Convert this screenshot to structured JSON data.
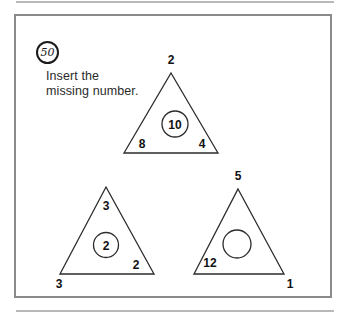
{
  "question": {
    "number": "50",
    "prompt_line1": "Insert the",
    "prompt_line2": "missing number."
  },
  "puzzle": {
    "type": "missing-number-triangles",
    "triangles": [
      {
        "id": "triangle-top",
        "apex_label": "2",
        "bottom_left_label": "8",
        "bottom_right_label": "4",
        "center_circle_label": "10",
        "center_circle_empty": false
      },
      {
        "id": "triangle-bottom-left",
        "apex_label": "3",
        "bottom_left_label": "3",
        "bottom_right_label": "2",
        "center_circle_label": "2",
        "center_circle_empty": false
      },
      {
        "id": "triangle-bottom-right",
        "apex_label": "5",
        "bottom_left_label": "12",
        "bottom_right_label": "1",
        "center_circle_label": "",
        "center_circle_empty": true
      }
    ]
  },
  "colors": {
    "ink": "#2b2b2b",
    "panel_border": "#8a8a8a",
    "background": "#ffffff"
  }
}
